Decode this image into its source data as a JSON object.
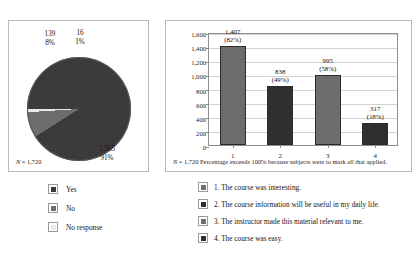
{
  "colors": {
    "dark": "#3b3b3b",
    "darker": "#2f2f2f",
    "medium": "#6d6d6d",
    "light": "#e9e9e9",
    "axis": "#8e8e8e",
    "grid": "#d3d3d3",
    "panel_border": "#b9b9b9"
  },
  "pie_panel": {
    "note_prefix": "N",
    "note_rest": " = 1,720",
    "labels": {
      "no": "139\n8%",
      "no_response": "16\n1%",
      "yes": "1,565\n91%"
    }
  },
  "bar_panel": {
    "note_prefix": "N",
    "note_rest": " = 1,720   Percentage exceeds 100% because subjects were to mark all that applied."
  },
  "legend_pie": {
    "items": [
      {
        "label": "Yes",
        "color": "#3b3b3b"
      },
      {
        "label": "No",
        "color": "#6d6d6d"
      },
      {
        "label": "No response",
        "color": "#e9e9e9"
      }
    ]
  },
  "legend_bar": {
    "items": [
      {
        "label": "1.  The course was interesting.",
        "color": "#6d6d6d"
      },
      {
        "label": "2.  The course information will be useful in my daily life.",
        "color": "#2f2f2f"
      },
      {
        "label": "3.  The instructor made this material relevant to me.",
        "color": "#6d6d6d"
      },
      {
        "label": "4.  The course was easy.",
        "color": "#2f2f2f"
      }
    ]
  },
  "chart_data": [
    {
      "type": "pie",
      "title": "",
      "categories": [
        "Yes",
        "No",
        "No response"
      ],
      "values": [
        1565,
        139,
        16
      ],
      "percent_labels": [
        "91%",
        "8%",
        "1%"
      ],
      "value_labels": [
        "1,565",
        "139",
        "16"
      ],
      "colors": [
        "#3b3b3b",
        "#6d6d6d",
        "#e9e9e9"
      ],
      "total_n": 1720,
      "note": "N = 1,720",
      "legend_position": "below"
    },
    {
      "type": "bar",
      "title": "",
      "categories": [
        "1",
        "2",
        "3",
        "4"
      ],
      "values": [
        1407,
        838,
        995,
        317
      ],
      "value_labels": [
        "1,407",
        "838",
        "995",
        "317"
      ],
      "percent_labels": [
        "(82%)",
        "(49%)",
        "(58%)",
        "(18%)"
      ],
      "colors": [
        "#6d6d6d",
        "#2f2f2f",
        "#6d6d6d",
        "#2f2f2f"
      ],
      "xlabel": "",
      "ylabel": "",
      "ylim": [
        0,
        1600
      ],
      "ytick_step": 200,
      "ytick_labels": [
        "0",
        "200",
        "400",
        "600",
        "800",
        "1,000",
        "1,200",
        "1,400",
        "1,600"
      ],
      "grid": true,
      "total_n": 1720,
      "note": "N = 1,720   Percentage exceeds 100% because subjects were to mark all that applied.",
      "legend_position": "below",
      "legend_entries": [
        "1.  The course was interesting.",
        "2.  The course information will be useful in my daily life.",
        "3.  The instructor made this material relevant to me.",
        "4.  The course was easy."
      ]
    }
  ]
}
